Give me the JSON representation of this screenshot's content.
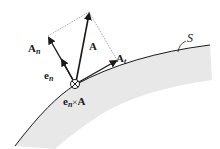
{
  "diagram": {
    "surface_label": "S",
    "vectors": {
      "A": "A",
      "A_n": {
        "base": "A",
        "sub": "n"
      },
      "A_t": {
        "base": "A",
        "sub": "t"
      },
      "e_n": {
        "base": "e",
        "sub": "n"
      }
    },
    "cross_product_label": {
      "e": "e",
      "sub": "n",
      "times": "×",
      "A": "A"
    },
    "colors": {
      "stroke": "#1a1a1a",
      "surface_shade": "#e6e6e6",
      "dotted": "#555555"
    }
  }
}
